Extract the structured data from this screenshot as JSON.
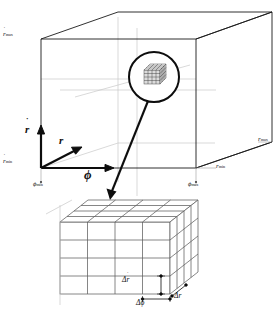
{
  "figure": {
    "type": "technical-diagram",
    "line_color": "#1a1a1a",
    "grid_color": "#6b6b6b",
    "faint_color": "#c9c9c9"
  },
  "axes": {
    "vertical": {
      "symbol": "r",
      "accent": "˙",
      "label": "r-dot"
    },
    "diagonal": {
      "symbol": "r",
      "accent": "",
      "label": "r"
    },
    "horizontal": {
      "symbol": "ϕ",
      "accent": "",
      "label": "phi"
    }
  },
  "bounds": {
    "rdot_max": {
      "symbol": "r",
      "accent": "˙",
      "sub": "max"
    },
    "rdot_min": {
      "symbol": "r",
      "accent": "˙",
      "sub": "min"
    },
    "r_max": {
      "symbol": "r",
      "accent": "",
      "sub": "max"
    },
    "r_min": {
      "symbol": "r",
      "accent": "",
      "sub": "min"
    },
    "phi_min": {
      "symbol": "ϕ",
      "accent": "",
      "sub": "min"
    },
    "phi_max": {
      "symbol": "ϕ",
      "accent": "",
      "sub": "max"
    }
  },
  "cell_labels": {
    "d_rdot": {
      "delta": "Δ",
      "symbol": "r",
      "accent": "˙"
    },
    "d_phi": {
      "delta": "Δ",
      "symbol": "ϕ",
      "accent": ""
    },
    "d_r": {
      "delta": "Δ",
      "symbol": "r",
      "accent": ""
    }
  },
  "magnifier": {
    "name": "magnifier-circle",
    "contents": "grid-cell-cluster"
  },
  "grid_cube": {
    "divisions_x": 4,
    "divisions_y": 4,
    "divisions_z": 4
  }
}
